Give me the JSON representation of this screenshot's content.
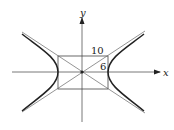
{
  "figure": {
    "type": "hyperbola",
    "equation_implied": "x^2/a^2 - y^2/b^2 = 1",
    "axes": {
      "x_label": "x",
      "y_label": "y"
    },
    "rectangle": {
      "width_label": "10",
      "height_label": "6"
    },
    "colors": {
      "ink": "#222222",
      "background": "#ffffff"
    }
  }
}
